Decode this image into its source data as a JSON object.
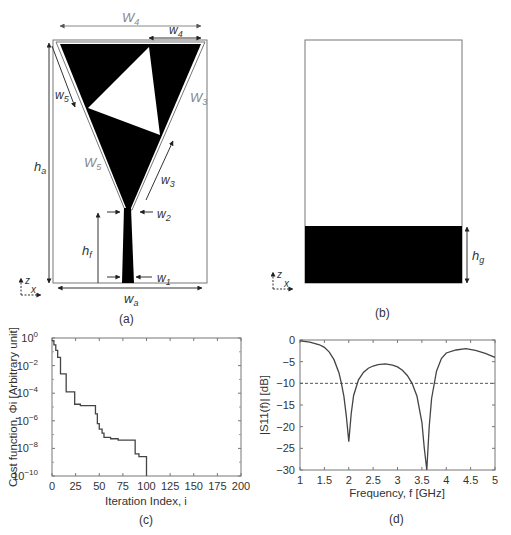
{
  "figure": {
    "panels": [
      {
        "id": "a",
        "caption": "(a)",
        "description": "Antenna top layer: inverted triangular patch with triangular slot and tapered feed line",
        "labels": {
          "W4_outer": "W",
          "W4_outer_sub": "4",
          "w4": "w",
          "w4_sub": "4",
          "w5": "w",
          "w5_sub": "5",
          "W3": "W",
          "W3_sub": "3",
          "W5": "W",
          "W5_sub": "5",
          "w3": "w",
          "w3_sub": "3",
          "w2": "w",
          "w2_sub": "2",
          "w1": "w",
          "w1_sub": "1",
          "ha": "h",
          "ha_sub": "a",
          "hf": "h",
          "hf_sub": "f",
          "wa": "w",
          "wa_sub": "a",
          "axis_z": "z",
          "axis_x": "x"
        }
      },
      {
        "id": "b",
        "caption": "(b)",
        "description": "Antenna bottom layer: ground plane",
        "labels": {
          "hg": "h",
          "hg_sub": "g",
          "axis_z": "z",
          "axis_x": "x"
        }
      }
    ]
  },
  "chart_data": [
    {
      "id": "c",
      "caption": "(c)",
      "type": "line",
      "title": "",
      "xlabel": "Iteration Index, i",
      "ylabel": "Cost function, Φi [Arbitrary unit]",
      "yscale": "log",
      "xlim": [
        0,
        200
      ],
      "ylim": [
        1e-10,
        1
      ],
      "xticks": [
        "0",
        "25",
        "50",
        "75",
        "100",
        "125",
        "150",
        "175",
        "200"
      ],
      "yticks": [
        "10^0",
        "10^-2",
        "10^-4",
        "10^-6",
        "10^-8",
        "10^-10"
      ],
      "grid": false,
      "series": [
        {
          "name": "cost",
          "style": "step",
          "x": [
            0,
            2,
            4,
            6,
            9,
            14,
            15,
            23,
            24,
            30,
            44,
            46,
            48,
            50,
            53,
            55,
            62,
            70,
            87,
            88,
            92,
            99,
            100
          ],
          "log10y": [
            -0.2,
            -0.5,
            -0.9,
            -1.4,
            -2.6,
            -2.6,
            -3.9,
            -3.9,
            -4.8,
            -4.9,
            -4.9,
            -5.5,
            -6.2,
            -6.6,
            -6.9,
            -7.2,
            -7.3,
            -7.4,
            -7.4,
            -8.4,
            -8.6,
            -8.6,
            -10.0
          ]
        }
      ]
    },
    {
      "id": "d",
      "caption": "(d)",
      "type": "line",
      "title": "",
      "xlabel": "Frequency, f [GHz]",
      "ylabel": "|S11(f)| [dB]",
      "xlim": [
        1,
        5
      ],
      "ylim": [
        -30,
        0
      ],
      "xticks": [
        "1",
        "1.5",
        "2",
        "2.5",
        "3",
        "3.5",
        "4",
        "4.5",
        "5"
      ],
      "yticks": [
        "0",
        "−5",
        "−10",
        "−15",
        "−20",
        "−25",
        "−30"
      ],
      "grid": false,
      "series": [
        {
          "name": "|S11|",
          "style": "solid",
          "x": [
            1.0,
            1.2,
            1.4,
            1.5,
            1.6,
            1.7,
            1.8,
            1.85,
            1.9,
            1.95,
            2.0,
            2.05,
            2.1,
            2.2,
            2.3,
            2.4,
            2.5,
            2.6,
            2.75,
            2.9,
            3.0,
            3.1,
            3.2,
            3.3,
            3.4,
            3.5,
            3.55,
            3.6,
            3.65,
            3.7,
            3.8,
            3.9,
            4.0,
            4.2,
            4.4,
            4.6,
            4.8,
            5.0
          ],
          "y": [
            -0.2,
            -0.5,
            -1.1,
            -1.7,
            -2.8,
            -4.6,
            -7.6,
            -10.0,
            -13.0,
            -17.5,
            -23.5,
            -17.0,
            -12.8,
            -9.2,
            -7.5,
            -6.5,
            -6.0,
            -5.7,
            -5.5,
            -5.8,
            -6.2,
            -7.0,
            -8.2,
            -10.0,
            -13.0,
            -19.0,
            -25.0,
            -30.0,
            -20.0,
            -13.5,
            -7.2,
            -4.3,
            -3.0,
            -2.3,
            -2.0,
            -2.4,
            -3.1,
            -4.0
          ]
        },
        {
          "name": "-10 dB threshold",
          "style": "dashed",
          "x": [
            1,
            5
          ],
          "y": [
            -10,
            -10
          ]
        }
      ]
    }
  ]
}
